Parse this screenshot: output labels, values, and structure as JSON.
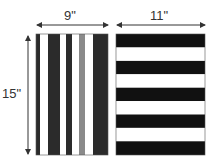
{
  "labels": {
    "width_left": "9\"",
    "width_right": "11\"",
    "height": "15\""
  },
  "colors": {
    "dark": "#2b2b2b",
    "black": "#111111",
    "gray": "#8a8a8a",
    "white": "#ffffff",
    "arrow": "#333333"
  },
  "left_panel": {
    "orientation": "vertical-stripes",
    "stripes": [
      "dark",
      "white",
      "dark",
      "white",
      "dark",
      "white",
      "gray",
      "white",
      "dark"
    ]
  },
  "right_panel": {
    "orientation": "horizontal-stripes",
    "stripes": [
      "black",
      "white",
      "black",
      "white",
      "black",
      "white",
      "black",
      "white",
      "black"
    ]
  }
}
